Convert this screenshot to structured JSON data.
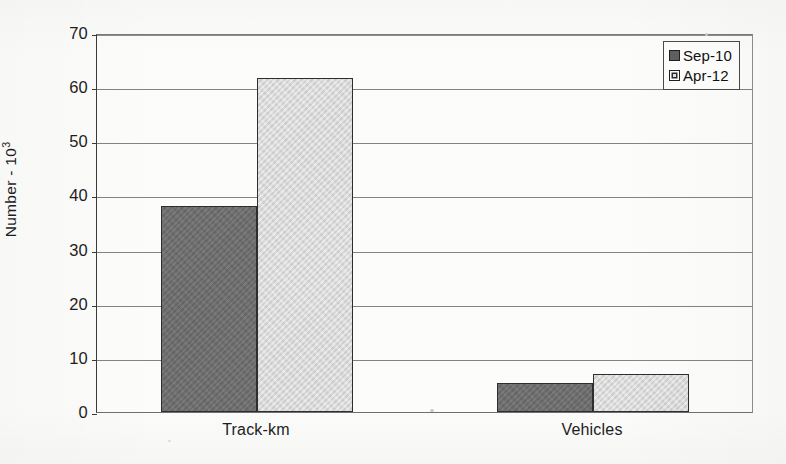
{
  "chart_data": {
    "type": "bar",
    "title": "",
    "xlabel": "",
    "ylabel": "Number - 10³",
    "ylabel_base": "Number - 10",
    "ylabel_exponent": "3",
    "categories": [
      "Track-km",
      "Vehicles"
    ],
    "series": [
      {
        "name": "Sep-10",
        "values": [
          38,
          5.3
        ],
        "color": "#6e6e6e"
      },
      {
        "name": "Apr-12",
        "values": [
          61.6,
          7.0
        ],
        "color": "#d9d9d9"
      }
    ],
    "ylim": [
      0,
      70
    ],
    "ytick_values": [
      0,
      10,
      20,
      30,
      40,
      50,
      60,
      70
    ],
    "ytick_labels": [
      "0",
      "10",
      "20",
      "30",
      "40",
      "50",
      "60",
      "70"
    ],
    "grid": true,
    "grid_axis": "y",
    "legend_position": "top-right",
    "legend_entries": [
      "Sep-10",
      "Apr-12"
    ]
  }
}
